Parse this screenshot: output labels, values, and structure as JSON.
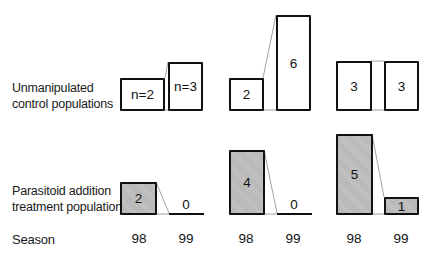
{
  "row_labels": {
    "control": [
      "Unmanipulated",
      "control populations"
    ],
    "treatment": [
      "Parasitoid addition",
      "treatment populations"
    ],
    "season": "Season"
  },
  "groups": [
    {
      "control": {
        "s98": "n=2",
        "s99": "n=3"
      },
      "treatment": {
        "s98": "2",
        "s99": "0"
      },
      "seasons": [
        "98",
        "99"
      ]
    },
    {
      "control": {
        "s98": "2",
        "s99": "6"
      },
      "treatment": {
        "s98": "4",
        "s99": "0"
      },
      "seasons": [
        "98",
        "99"
      ]
    },
    {
      "control": {
        "s98": "3",
        "s99": "3"
      },
      "treatment": {
        "s98": "5",
        "s99": "1"
      },
      "seasons": [
        "98",
        "99"
      ]
    }
  ],
  "colors": {
    "outline": "#111111",
    "shade": "#c4c4c4",
    "connector": "#888888"
  }
}
